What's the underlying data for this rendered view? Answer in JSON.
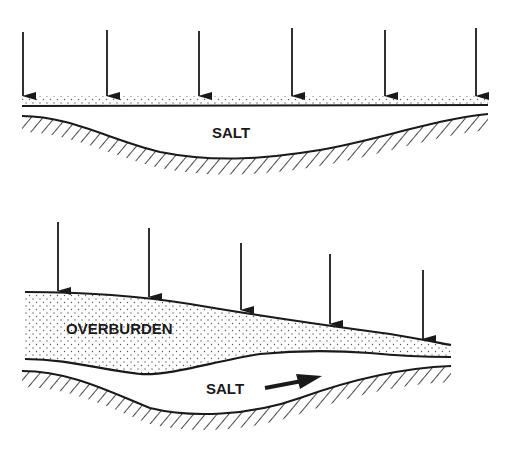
{
  "diagram": {
    "colors": {
      "ink": "#1a1a1a",
      "background": "#ffffff",
      "stipple": "#555555"
    },
    "top_panel": {
      "label_salt": "SALT",
      "arrow_count": 6,
      "description": "Uniform overburden load on salt layer"
    },
    "bottom_panel": {
      "label_overburden": "OVERBURDEN",
      "label_salt": "SALT",
      "arrow_count": 5,
      "description": "Differential overburden load driving salt flow toward thinner overburden"
    }
  }
}
